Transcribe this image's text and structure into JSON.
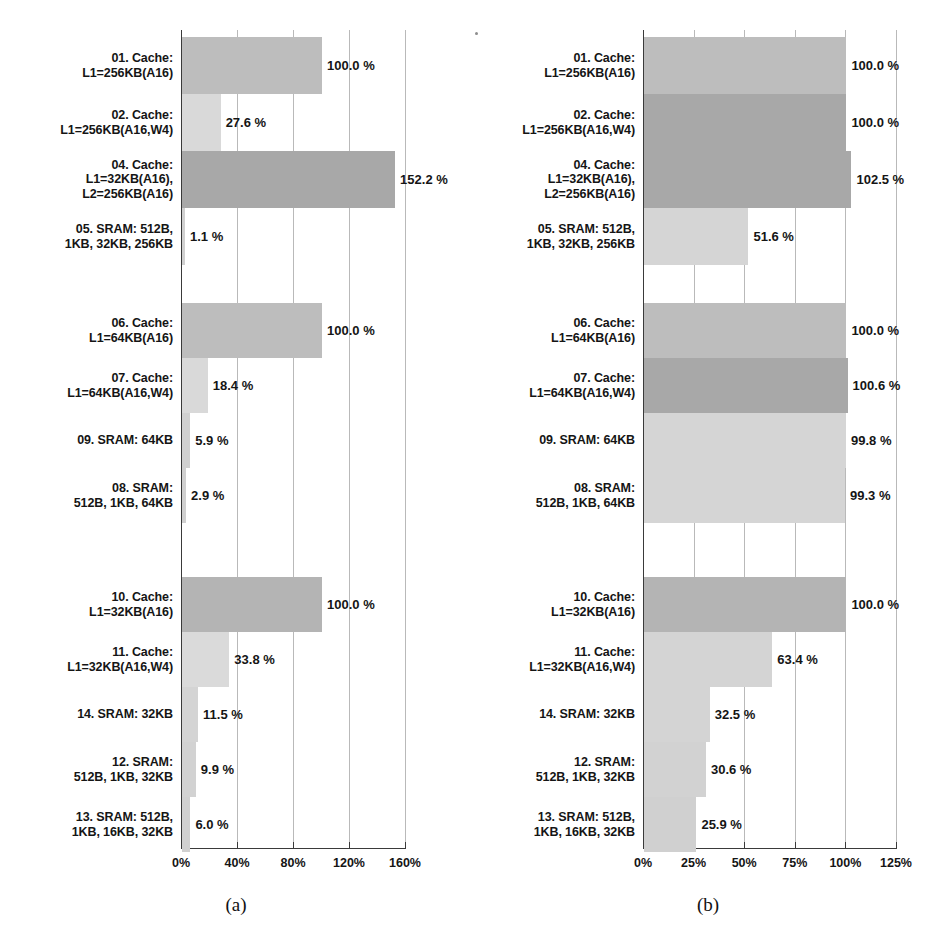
{
  "figure": {
    "panels": [
      {
        "caption": "(a)",
        "axis": {
          "ticks": [
            "0%",
            "40%",
            "80%",
            "120%",
            "160%"
          ],
          "tick_values": [
            0,
            40,
            80,
            120,
            160
          ],
          "xlim": [
            0,
            160
          ]
        },
        "groups": [
          {
            "bars": [
              {
                "label": "01. Cache:\nL1=256KB(A16)",
                "value": 100.0,
                "value_label": "100.0 %",
                "color": "#bdbdbd"
              },
              {
                "label": "02. Cache:\nL1=256KB(A16,W4)",
                "value": 27.6,
                "value_label": "27.6 %",
                "color": "#d9d9d9"
              },
              {
                "label": "04. Cache:\nL1=32KB(A16),\nL2=256KB(A16)",
                "value": 152.2,
                "value_label": "152.2 %",
                "color": "#a8a8a8"
              },
              {
                "label": "05. SRAM: 512B,\n1KB, 32KB, 256KB",
                "value": 1.1,
                "value_label": "1.1 %",
                "color": "#d0d0d0"
              }
            ]
          },
          {
            "bars": [
              {
                "label": "06. Cache:\nL1=64KB(A16)",
                "value": 100.0,
                "value_label": "100.0 %",
                "color": "#bdbdbd"
              },
              {
                "label": "07. Cache:\nL1=64KB(A16,W4)",
                "value": 18.4,
                "value_label": "18.4 %",
                "color": "#d9d9d9"
              },
              {
                "label": "09. SRAM: 64KB",
                "value": 5.9,
                "value_label": "5.9 %",
                "color": "#d0d0d0"
              },
              {
                "label": "08. SRAM:\n512B, 1KB, 64KB",
                "value": 2.9,
                "value_label": "2.9 %",
                "color": "#d0d0d0"
              }
            ]
          },
          {
            "bars": [
              {
                "label": "10. Cache:\nL1=32KB(A16)",
                "value": 100.0,
                "value_label": "100.0 %",
                "color": "#b4b4b4"
              },
              {
                "label": "11. Cache:\nL1=32KB(A16,W4)",
                "value": 33.8,
                "value_label": "33.8 %",
                "color": "#dadada"
              },
              {
                "label": "14. SRAM: 32KB",
                "value": 11.5,
                "value_label": "11.5 %",
                "color": "#d4d4d4"
              },
              {
                "label": "12. SRAM:\n512B, 1KB, 32KB",
                "value": 9.9,
                "value_label": "9.9 %",
                "color": "#d2d2d2"
              },
              {
                "label": "13. SRAM: 512B,\n1KB, 16KB, 32KB",
                "value": 6.0,
                "value_label": "6.0 %",
                "color": "#d0d0d0"
              }
            ]
          }
        ]
      },
      {
        "caption": "(b)",
        "axis": {
          "ticks": [
            "0%",
            "25%",
            "50%",
            "75%",
            "100%",
            "125%"
          ],
          "tick_values": [
            0,
            25,
            50,
            75,
            100,
            125
          ],
          "xlim": [
            0,
            125
          ]
        },
        "groups": [
          {
            "bars": [
              {
                "label": "01. Cache:\nL1=256KB(A16)",
                "value": 100.0,
                "value_label": "100.0 %",
                "color": "#bdbdbd"
              },
              {
                "label": "02. Cache:\nL1=256KB(A16,W4)",
                "value": 100.0,
                "value_label": "100.0 %",
                "color": "#a8a8a8"
              },
              {
                "label": "04. Cache:\nL1=32KB(A16),\nL2=256KB(A16)",
                "value": 102.5,
                "value_label": "102.5 %",
                "color": "#a8a8a8"
              },
              {
                "label": "05. SRAM: 512B,\n1KB, 32KB, 256KB",
                "value": 51.6,
                "value_label": "51.6 %",
                "color": "#d5d5d5"
              }
            ]
          },
          {
            "bars": [
              {
                "label": "06. Cache:\nL1=64KB(A16)",
                "value": 100.0,
                "value_label": "100.0 %",
                "color": "#bdbdbd"
              },
              {
                "label": "07. Cache:\nL1=64KB(A16,W4)",
                "value": 100.6,
                "value_label": "100.6 %",
                "color": "#a8a8a8"
              },
              {
                "label": "09. SRAM: 64KB",
                "value": 99.8,
                "value_label": "99.8 %",
                "color": "#d5d5d5"
              },
              {
                "label": "08. SRAM:\n512B, 1KB, 64KB",
                "value": 99.3,
                "value_label": "99.3 %",
                "color": "#d5d5d5"
              }
            ]
          },
          {
            "bars": [
              {
                "label": "10. Cache:\nL1=32KB(A16)",
                "value": 100.0,
                "value_label": "100.0 %",
                "color": "#b4b4b4"
              },
              {
                "label": "11. Cache:\nL1=32KB(A16,W4)",
                "value": 63.4,
                "value_label": "63.4 %",
                "color": "#d4d4d4"
              },
              {
                "label": "14. SRAM: 32KB",
                "value": 32.5,
                "value_label": "32.5 %",
                "color": "#d4d4d4"
              },
              {
                "label": "12. SRAM:\n512B, 1KB, 32KB",
                "value": 30.6,
                "value_label": "30.6 %",
                "color": "#d2d2d2"
              },
              {
                "label": "13. SRAM: 512B,\n1KB, 16KB, 32KB",
                "value": 25.9,
                "value_label": "25.9 %",
                "color": "#d0d0d0"
              }
            ]
          }
        ]
      }
    ]
  },
  "chart_data": [
    {
      "type": "bar",
      "orientation": "horizontal",
      "title": "(a)",
      "xlabel": "",
      "ylabel": "",
      "xlim": [
        0,
        160
      ],
      "xticks": [
        0,
        40,
        80,
        120,
        160
      ],
      "xticklabels": [
        "0%",
        "40%",
        "80%",
        "120%",
        "160%"
      ],
      "grid": true,
      "legend": "none",
      "categories": [
        "01. Cache: L1=256KB(A16)",
        "02. Cache: L1=256KB(A16,W4)",
        "04. Cache: L1=32KB(A16), L2=256KB(A16)",
        "05. SRAM: 512B, 1KB, 32KB, 256KB",
        "06. Cache: L1=64KB(A16)",
        "07. Cache: L1=64KB(A16,W4)",
        "09. SRAM: 64KB",
        "08. SRAM: 512B, 1KB, 64KB",
        "10. Cache: L1=32KB(A16)",
        "11. Cache: L1=32KB(A16,W4)",
        "14. SRAM: 32KB",
        "12. SRAM: 512B, 1KB, 32KB",
        "13. SRAM: 512B, 1KB, 16KB, 32KB"
      ],
      "values": [
        100.0,
        27.6,
        152.2,
        1.1,
        100.0,
        18.4,
        5.9,
        2.9,
        100.0,
        33.8,
        11.5,
        9.9,
        6.0
      ],
      "data_labels": [
        "100.0 %",
        "27.6 %",
        "152.2 %",
        "1.1 %",
        "100.0 %",
        "18.4 %",
        "5.9 %",
        "2.9 %",
        "100.0 %",
        "33.8 %",
        "11.5 %",
        "9.9 %",
        "6.0 %"
      ]
    },
    {
      "type": "bar",
      "orientation": "horizontal",
      "title": "(b)",
      "xlabel": "",
      "ylabel": "",
      "xlim": [
        0,
        125
      ],
      "xticks": [
        0,
        25,
        50,
        75,
        100,
        125
      ],
      "xticklabels": [
        "0%",
        "25%",
        "50%",
        "75%",
        "100%",
        "125%"
      ],
      "grid": true,
      "legend": "none",
      "categories": [
        "01. Cache: L1=256KB(A16)",
        "02. Cache: L1=256KB(A16,W4)",
        "04. Cache: L1=32KB(A16), L2=256KB(A16)",
        "05. SRAM: 512B, 1KB, 32KB, 256KB",
        "06. Cache: L1=64KB(A16)",
        "07. Cache: L1=64KB(A16,W4)",
        "09. SRAM: 64KB",
        "08. SRAM: 512B, 1KB, 64KB",
        "10. Cache: L1=32KB(A16)",
        "11. Cache: L1=32KB(A16,W4)",
        "14. SRAM: 32KB",
        "12. SRAM: 512B, 1KB, 32KB",
        "13. SRAM: 512B, 1KB, 16KB, 32KB"
      ],
      "values": [
        100.0,
        100.0,
        102.5,
        51.6,
        100.0,
        100.6,
        99.8,
        99.3,
        100.0,
        63.4,
        32.5,
        30.6,
        25.9
      ],
      "data_labels": [
        "100.0 %",
        "100.0 %",
        "102.5 %",
        "51.6 %",
        "100.0 %",
        "100.6 %",
        "99.8 %",
        "99.3 %",
        "100.0 %",
        "63.4 %",
        "32.5 %",
        "30.6 %",
        "25.9 %"
      ]
    }
  ]
}
